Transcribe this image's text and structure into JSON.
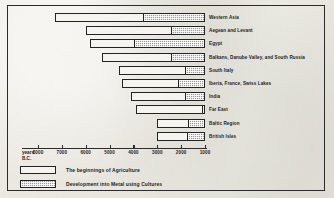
{
  "chart_data": {
    "type": "bar",
    "orientation": "horizontal",
    "stacked": true,
    "title": "",
    "xlabel_line1": "years",
    "xlabel_line2": "B.C.",
    "ylabel": "",
    "x_ticks": [
      8000,
      7000,
      6000,
      5000,
      4000,
      3000,
      2000,
      1000
    ],
    "x_tick_labels": [
      "8000",
      "7000",
      "6000",
      "5000",
      "4000",
      "3000",
      "2000",
      "1000"
    ],
    "xlim": [
      8300,
      950
    ],
    "x_axis_direction": "decreasing",
    "grid": false,
    "legend_position": "below-axis-left",
    "categories": [
      "Western Asia",
      "Aegean and Levant",
      "Egypt",
      "Balkans, Danube Valley, and South Russia",
      "South Italy",
      "Iberia, France, Swiss Lakes",
      "India",
      "Far East",
      "Baltic Region",
      "British Isles"
    ],
    "series": [
      {
        "name": "The beginnings of Agriculture",
        "color": "#f6f4ee",
        "start_bc": [
          7300,
          6000,
          5800,
          5300,
          4600,
          4500,
          4100,
          3900,
          3000,
          3000
        ],
        "end_bc": [
          3600,
          2400,
          4000,
          2400,
          1800,
          2100,
          1800,
          1100,
          1700,
          1750
        ]
      },
      {
        "name": "Development into Metal using Cultures",
        "color": "#9a9a93",
        "start_bc": [
          3600,
          2400,
          4000,
          2400,
          1800,
          2100,
          1800,
          1100,
          1700,
          1750
        ],
        "end_bc": [
          1000,
          1000,
          1000,
          1000,
          1000,
          1000,
          1000,
          1000,
          1000,
          1000
        ]
      }
    ],
    "legend": [
      {
        "key": "agri",
        "label": "The beginnings of Agriculture"
      },
      {
        "key": "metal",
        "label": "Development into Metal using Cultures"
      }
    ]
  }
}
